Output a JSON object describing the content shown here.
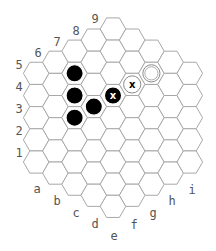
{
  "board": {
    "type": "hex-hexagonal",
    "size": 5,
    "columns": [
      "a",
      "b",
      "c",
      "d",
      "e",
      "f",
      "g",
      "h",
      "i"
    ],
    "rows": [
      "1",
      "2",
      "3",
      "4",
      "5",
      "6",
      "7",
      "8",
      "9"
    ],
    "colors": {
      "background": "#ffffff",
      "grid_line": "#a8a8a8",
      "label": "#555555",
      "black_stone": "#000000",
      "white_stone": "#ffffff"
    }
  },
  "labels": {
    "left": [
      {
        "text": "5",
        "x": 19,
        "y": 69
      },
      {
        "text": "4",
        "x": 19,
        "y": 91
      },
      {
        "text": "3",
        "x": 19,
        "y": 113
      },
      {
        "text": "2",
        "x": 19,
        "y": 135
      },
      {
        "text": "1",
        "x": 19,
        "y": 157
      }
    ],
    "top": [
      {
        "text": "6",
        "x": 38,
        "y": 57
      },
      {
        "text": "7",
        "x": 57,
        "y": 46
      },
      {
        "text": "8",
        "x": 76,
        "y": 35
      },
      {
        "text": "9",
        "x": 95,
        "y": 23
      }
    ],
    "bottom": [
      {
        "text": "a",
        "x": 37,
        "y": 193
      },
      {
        "text": "b",
        "x": 57,
        "y": 205
      },
      {
        "text": "c",
        "x": 76,
        "y": 217
      },
      {
        "text": "d",
        "x": 95,
        "y": 228
      },
      {
        "text": "e",
        "x": 114,
        "y": 240
      },
      {
        "text": "f",
        "x": 134,
        "y": 229
      },
      {
        "text": "g",
        "x": 153,
        "y": 217
      },
      {
        "text": "h",
        "x": 172,
        "y": 205
      },
      {
        "text": "i",
        "x": 192,
        "y": 194
      }
    ]
  },
  "stones": [
    {
      "cell": "c6",
      "color": "black",
      "mark": ""
    },
    {
      "cell": "c5",
      "color": "black",
      "mark": ""
    },
    {
      "cell": "c4",
      "color": "black",
      "mark": ""
    },
    {
      "cell": "d5",
      "color": "black",
      "mark": ""
    },
    {
      "cell": "e6",
      "color": "black",
      "mark": "x"
    },
    {
      "cell": "f7",
      "color": "white",
      "mark": "x"
    },
    {
      "cell": "g8",
      "color": "white",
      "mark": "ring"
    }
  ]
}
